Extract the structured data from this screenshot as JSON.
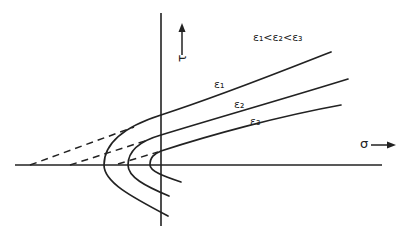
{
  "diagram": {
    "type": "stress-strain-family",
    "labels": {
      "condition": "ε₁<ε₂<ε₃",
      "tau_axis": "τ",
      "sigma_axis": "σ",
      "curve_1": "ε₁",
      "curve_2": "ε₂",
      "curve_3": "ε₃"
    },
    "colors": {
      "ink": "#222222",
      "background": "#ffffff"
    }
  }
}
